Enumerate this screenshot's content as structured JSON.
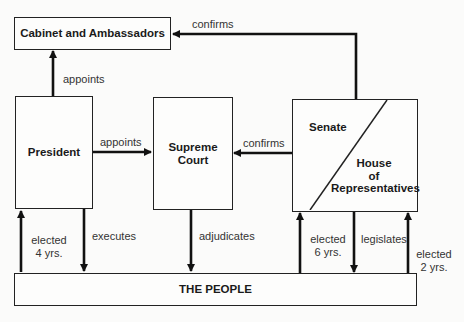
{
  "diagram": {
    "type": "flowchart",
    "nodes": {
      "cabinet": "Cabinet and Ambassadors",
      "president": "President",
      "court_line1": "Supreme",
      "court_line2": "Court",
      "senate": "Senate",
      "house_line1": "House",
      "house_line2": "of",
      "house_line3": "Representatives",
      "people": "THE PEOPLE"
    },
    "edges": {
      "president_appoints_cabinet": "appoints",
      "congress_confirms_cabinet": "confirms",
      "president_appoints_court": "appoints",
      "senate_confirms_court": "confirms",
      "people_elect_president_1": "elected",
      "people_elect_president_2": "4 yrs.",
      "president_executes": "executes",
      "court_adjudicates": "adjudicates",
      "people_elect_senate_1": "elected",
      "people_elect_senate_2": "6 yrs.",
      "congress_legislates": "legislates",
      "people_elect_house_1": "elected",
      "people_elect_house_2": "2 yrs."
    }
  }
}
